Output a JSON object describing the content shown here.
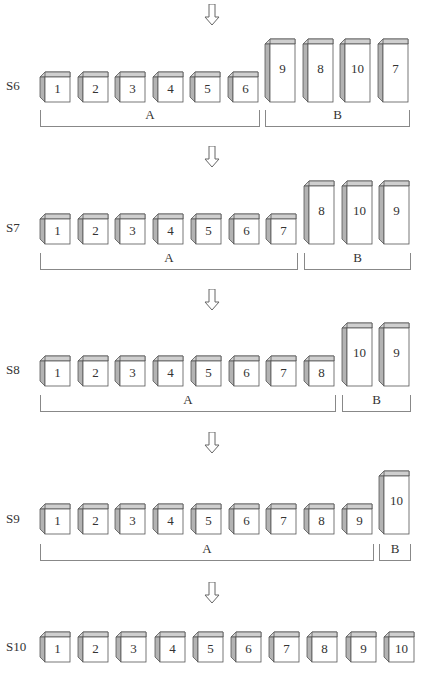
{
  "steps": [
    {
      "label": "S6",
      "boxes": [
        {
          "n": "1",
          "tall": false
        },
        {
          "n": "2",
          "tall": false
        },
        {
          "n": "3",
          "tall": false
        },
        {
          "n": "4",
          "tall": false
        },
        {
          "n": "5",
          "tall": false
        },
        {
          "n": "6",
          "tall": false
        },
        {
          "n": "9",
          "tall": true
        },
        {
          "n": "8",
          "tall": true
        },
        {
          "n": "10",
          "tall": true
        },
        {
          "n": "7",
          "tall": true
        }
      ],
      "groups": [
        {
          "label": "A",
          "from": 0,
          "to": 5
        },
        {
          "label": "B",
          "from": 6,
          "to": 9
        }
      ]
    },
    {
      "label": "S7",
      "boxes": [
        {
          "n": "1",
          "tall": false
        },
        {
          "n": "2",
          "tall": false
        },
        {
          "n": "3",
          "tall": false
        },
        {
          "n": "4",
          "tall": false
        },
        {
          "n": "5",
          "tall": false
        },
        {
          "n": "6",
          "tall": false
        },
        {
          "n": "7",
          "tall": false
        },
        {
          "n": "8",
          "tall": true
        },
        {
          "n": "10",
          "tall": true
        },
        {
          "n": "9",
          "tall": true
        }
      ],
      "groups": [
        {
          "label": "A",
          "from": 0,
          "to": 6
        },
        {
          "label": "B",
          "from": 7,
          "to": 9
        }
      ]
    },
    {
      "label": "S8",
      "boxes": [
        {
          "n": "1",
          "tall": false
        },
        {
          "n": "2",
          "tall": false
        },
        {
          "n": "3",
          "tall": false
        },
        {
          "n": "4",
          "tall": false
        },
        {
          "n": "5",
          "tall": false
        },
        {
          "n": "6",
          "tall": false
        },
        {
          "n": "7",
          "tall": false
        },
        {
          "n": "8",
          "tall": false
        },
        {
          "n": "10",
          "tall": true
        },
        {
          "n": "9",
          "tall": true
        }
      ],
      "groups": [
        {
          "label": "A",
          "from": 0,
          "to": 7
        },
        {
          "label": "B",
          "from": 8,
          "to": 9
        }
      ]
    },
    {
      "label": "S9",
      "boxes": [
        {
          "n": "1",
          "tall": false
        },
        {
          "n": "2",
          "tall": false
        },
        {
          "n": "3",
          "tall": false
        },
        {
          "n": "4",
          "tall": false
        },
        {
          "n": "5",
          "tall": false
        },
        {
          "n": "6",
          "tall": false
        },
        {
          "n": "7",
          "tall": false
        },
        {
          "n": "8",
          "tall": false
        },
        {
          "n": "9",
          "tall": false
        },
        {
          "n": "10",
          "tall": true
        }
      ],
      "groups": [
        {
          "label": "A",
          "from": 0,
          "to": 8
        },
        {
          "label": "B",
          "from": 9,
          "to": 9
        }
      ]
    },
    {
      "label": "S10",
      "boxes": [
        {
          "n": "1",
          "tall": false
        },
        {
          "n": "2",
          "tall": false
        },
        {
          "n": "3",
          "tall": false
        },
        {
          "n": "4",
          "tall": false
        },
        {
          "n": "5",
          "tall": false
        },
        {
          "n": "6",
          "tall": false
        },
        {
          "n": "7",
          "tall": false
        },
        {
          "n": "8",
          "tall": false
        },
        {
          "n": "9",
          "tall": false
        },
        {
          "n": "10",
          "tall": false
        }
      ],
      "groups": []
    }
  ],
  "colors": {
    "side": "#b3b3b3",
    "top": "#cfcfcf",
    "front": "#ffffff",
    "stroke": "#555555",
    "bracket": "#888888"
  }
}
